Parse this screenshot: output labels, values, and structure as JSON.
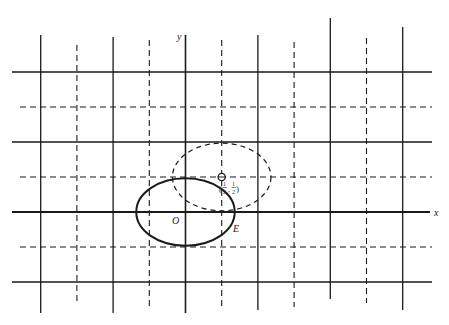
{
  "diagram": {
    "axes": {
      "x_label": "x",
      "y_label": "y",
      "origin_label": "O"
    },
    "grid": {
      "x_range": [
        -2,
        3
      ],
      "y_range": [
        -1,
        2
      ],
      "solid_lines_at": "integers",
      "dashed_lines_at": "half-integers"
    },
    "shapes": [
      {
        "name": "E",
        "label": "E",
        "style": "solid",
        "center": [
          0,
          0
        ],
        "radius": 0.68
      },
      {
        "name": "translated-E",
        "label": "",
        "style": "dashed",
        "center": [
          0.5,
          0.5
        ],
        "radius": 0.68
      }
    ],
    "point": {
      "coords": [
        0.5,
        0.5
      ],
      "label_num": "1",
      "label_den": "2",
      "label": "(1/2, 1/2)"
    },
    "colors": {
      "ink": "#1a1a1a",
      "background": "#ffffff"
    }
  }
}
